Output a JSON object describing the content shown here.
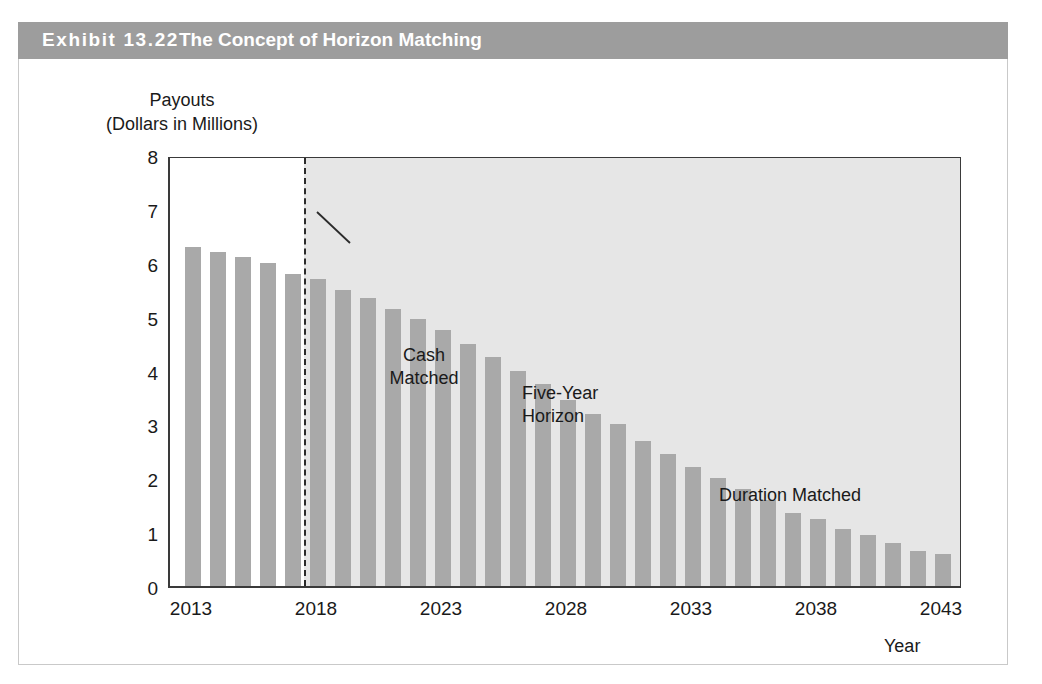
{
  "exhibit": {
    "label": "Exhibit 13.22",
    "title": "The Concept of Horizon Matching",
    "band_color": "#9d9d9d",
    "band_text_color": "#ffffff"
  },
  "chart_data": {
    "type": "bar",
    "title": "The Concept of Horizon Matching",
    "xlabel": "Year",
    "ylabel": "Payouts\n(Dollars in Millions)",
    "ylabel_line1": "Payouts",
    "ylabel_line2": "(Dollars in Millions)",
    "ylim": [
      0,
      8
    ],
    "xlim": [
      2013,
      2043
    ],
    "grid": false,
    "legend": "none",
    "bar_color": "#a9a9a9",
    "shaded_region_color": "#e6e6e6",
    "y_ticks": [
      "8",
      "7",
      "6",
      "5",
      "4",
      "3",
      "2",
      "1",
      "0"
    ],
    "y_tick_values": [
      8,
      7,
      6,
      5,
      4,
      3,
      2,
      1,
      0
    ],
    "x_ticks": [
      "2013",
      "2018",
      "2023",
      "2028",
      "2033",
      "2038",
      "2043"
    ],
    "x_tick_values": [
      2013,
      2018,
      2023,
      2028,
      2033,
      2038,
      2043
    ],
    "categories": [
      2013,
      2014,
      2015,
      2016,
      2017,
      2018,
      2019,
      2020,
      2021,
      2022,
      2023,
      2024,
      2025,
      2026,
      2027,
      2028,
      2029,
      2030,
      2031,
      2032,
      2033,
      2034,
      2035,
      2036,
      2037,
      2038,
      2039,
      2040,
      2041,
      2042,
      2043
    ],
    "values": [
      6.3,
      6.2,
      6.1,
      6.0,
      5.8,
      5.7,
      5.5,
      5.35,
      5.15,
      4.95,
      4.75,
      4.5,
      4.25,
      4.0,
      3.75,
      3.45,
      3.2,
      3.0,
      2.7,
      2.45,
      2.2,
      2.0,
      1.8,
      1.6,
      1.35,
      1.25,
      1.05,
      0.95,
      0.8,
      0.65,
      0.6
    ],
    "annotations": [
      {
        "name": "cash-matched",
        "text": "Cash\nMatched",
        "x": 2014.5,
        "y": 7.3
      },
      {
        "name": "five-year-horizon",
        "text": "Five-Year\nHorizon",
        "x": 2020,
        "y": 6.6
      },
      {
        "name": "duration-matched",
        "text": "Duration Matched",
        "x": 2029,
        "y": 4.8
      }
    ],
    "vertical_marker": {
      "name": "five-year-horizon-line",
      "style": "dashed",
      "x": 2018,
      "label": "Five-Year Horizon"
    },
    "regions": [
      {
        "name": "cash-matched-region",
        "from": 2013,
        "to": 2018,
        "fill": "#ffffff"
      },
      {
        "name": "duration-matched-region",
        "from": 2018,
        "to": 2043,
        "fill": "#e6e6e6"
      }
    ]
  },
  "annotations": {
    "cash_matched": "Cash\nMatched",
    "five_year_horizon": "Five-Year\nHorizon",
    "duration_matched": "Duration Matched"
  },
  "axes": {
    "y_title_line1": "Payouts",
    "y_title_line2": "(Dollars in Millions)",
    "x_title": "Year"
  }
}
